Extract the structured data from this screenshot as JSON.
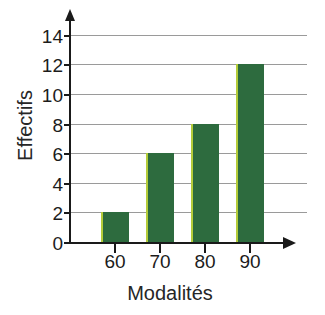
{
  "chart_data": {
    "type": "bar",
    "title": "",
    "xlabel": "Modalités",
    "ylabel": "Effectifs",
    "categories": [
      "60",
      "70",
      "80",
      "90"
    ],
    "values": [
      2,
      6,
      8,
      12
    ],
    "series": [
      {
        "name": "Effectifs",
        "values": [
          2,
          6,
          8,
          12
        ]
      }
    ],
    "ylim": [
      0,
      15
    ],
    "xlim": [
      55,
      100
    ],
    "yticks": [
      0,
      2,
      4,
      6,
      8,
      10,
      12,
      14
    ],
    "ytick_labels": [
      "0",
      "2",
      "4",
      "6",
      "8",
      "10",
      "12",
      "14"
    ],
    "xtick_labels": [
      "60",
      "70",
      "80",
      "90"
    ],
    "grid": "horizontal",
    "legend": "none",
    "bar_color": "#2d6b3e",
    "bar_edge_color": "#b4cc3a",
    "grid_color": "#9a9a9a",
    "axis_color": "#1a1a1a",
    "background_color": "#ffffff",
    "axis_arrows": true,
    "annotations": []
  }
}
